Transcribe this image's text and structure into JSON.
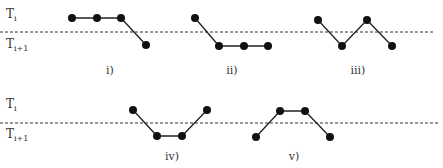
{
  "rows": [
    {
      "level_top_label": "T",
      "level_top_sub": "i",
      "level_bottom_label": "T",
      "level_bottom_sub": "i+1",
      "threshold_y": 32
    },
    {
      "level_top_label": "T",
      "level_top_sub": "i",
      "level_bottom_label": "T",
      "level_bottom_sub": "i+1",
      "threshold_y": 123
    }
  ],
  "panels": [
    {
      "label": "i)",
      "pattern": [
        "high",
        "high",
        "high",
        "low"
      ]
    },
    {
      "label": "ii)",
      "pattern": [
        "high",
        "low",
        "low",
        "low"
      ]
    },
    {
      "label": "iii)",
      "pattern": [
        "high",
        "low",
        "high",
        "low"
      ]
    },
    {
      "label": "iv)",
      "pattern": [
        "high",
        "low",
        "low",
        "high"
      ]
    },
    {
      "label": "v)",
      "pattern": [
        "low",
        "high",
        "high",
        "low"
      ]
    }
  ],
  "colors": {
    "line": "#222222",
    "dot": "#111111",
    "dash": "#333333",
    "text": "#333333"
  }
}
